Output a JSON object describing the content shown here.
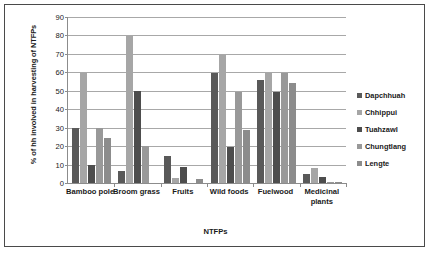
{
  "chart_data": {
    "type": "bar",
    "title": "",
    "xlabel": "NTFPs",
    "ylabel": "% of hh involved in  harvesting of NTFPs",
    "ylim": [
      0,
      90
    ],
    "ytick_step": 10,
    "yticks": [
      0,
      10,
      20,
      30,
      40,
      50,
      60,
      70,
      80,
      90
    ],
    "grid": true,
    "legend_position": "right",
    "categories": [
      "Bamboo pole",
      "Broom grass",
      "Fruits",
      "Wild foods",
      "Fuelwood",
      "Medicinal plants"
    ],
    "series": [
      {
        "name": "Dapchhuah",
        "color": "#595959",
        "values": [
          29.8,
          6.5,
          14.4,
          59.5,
          56.0,
          5.0
        ]
      },
      {
        "name": "Chhippui",
        "color": "#a6a6a6",
        "values": [
          59.8,
          79.8,
          2.5,
          69.5,
          59.5,
          8.0
        ]
      },
      {
        "name": "Tuahzawl",
        "color": "#4d4d4d",
        "values": [
          9.8,
          49.7,
          8.5,
          19.5,
          49.3,
          3.0
        ]
      },
      {
        "name": "Chungtlang",
        "color": "#999999",
        "values": [
          29.6,
          19.9,
          0.0,
          49.5,
          59.5,
          0.8
        ]
      },
      {
        "name": "Lengte",
        "color": "#8c8c8c",
        "values": [
          24.5,
          0.0,
          2.3,
          28.6,
          54.2,
          0.8
        ]
      }
    ]
  },
  "legend": {
    "items": [
      {
        "label": "Dapchhuah"
      },
      {
        "label": "Chhippui"
      },
      {
        "label": "Tuahzawl"
      },
      {
        "label": "Chungtlang"
      },
      {
        "label": "Lengte"
      }
    ]
  }
}
